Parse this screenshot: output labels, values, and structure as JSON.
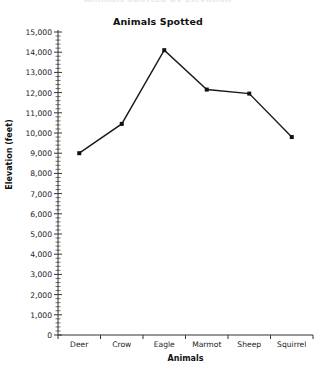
{
  "figure": {
    "clipped_top_text": "Animals Spotted by Elevation",
    "background_color": "#ffffff",
    "line_color": "#1a1a1a",
    "marker_color": "#111111",
    "axis_color": "#333333"
  },
  "chart_data": {
    "type": "line",
    "title": "Animals Spotted",
    "xlabel": "Animals",
    "ylabel": "Elevation (feet)",
    "categories": [
      "Deer",
      "Crow",
      "Eagle",
      "Marmot",
      "Sheep",
      "Squirrel"
    ],
    "values": [
      9000,
      10450,
      14100,
      12150,
      11950,
      9800
    ],
    "series": [
      {
        "name": "Elevation",
        "values": [
          9000,
          10450,
          14100,
          12150,
          11950,
          9800
        ]
      }
    ],
    "ylim": [
      0,
      15000
    ],
    "ytick_step": 1000,
    "yticks": [
      0,
      1000,
      2000,
      3000,
      4000,
      5000,
      6000,
      7000,
      8000,
      9000,
      10000,
      11000,
      12000,
      13000,
      14000,
      15000
    ],
    "ytick_labels": [
      "0",
      "1,000",
      "2,000",
      "3,000",
      "4,000",
      "5,000",
      "6,000",
      "7,000",
      "8,000",
      "9,000",
      "10,000",
      "11,000",
      "12,000",
      "13,000",
      "14,000",
      "15,000"
    ],
    "minor_ticks": true,
    "minor_tick_step": 200,
    "grid": false,
    "legend": null,
    "marker": "square",
    "marker_size": 4
  }
}
